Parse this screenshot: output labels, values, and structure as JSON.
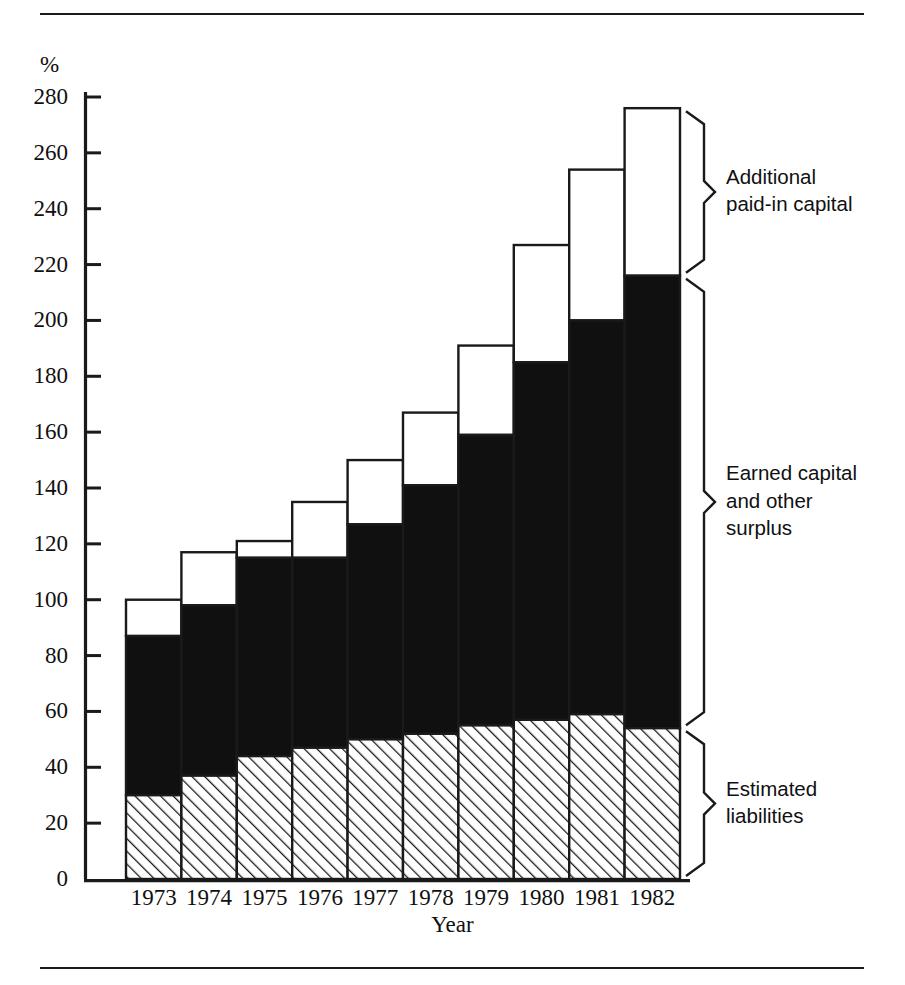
{
  "chart_data": {
    "type": "bar",
    "stacked": true,
    "title": "",
    "xlabel": "Year",
    "ylabel": "%",
    "ylim": [
      0,
      280
    ],
    "ytick_step": 20,
    "yticks": [
      0,
      20,
      40,
      60,
      80,
      100,
      120,
      140,
      160,
      180,
      200,
      220,
      240,
      260,
      280
    ],
    "categories": [
      "1973",
      "1974",
      "1975",
      "1976",
      "1977",
      "1978",
      "1979",
      "1980",
      "1981",
      "1982"
    ],
    "grid": false,
    "legend_position": "right-braces",
    "series": [
      {
        "name": "Estimated liabilities",
        "fill": "hatch-diagonal",
        "values": [
          30,
          37,
          44,
          47,
          50,
          52,
          55,
          57,
          59,
          54
        ]
      },
      {
        "name": "Earned capital and other surplus",
        "fill": "solid-black",
        "values": [
          57,
          61,
          71,
          68,
          77,
          89,
          104,
          128,
          141,
          162
        ]
      },
      {
        "name": "Additional paid-in capital",
        "fill": "white",
        "values": [
          13,
          19,
          6,
          20,
          23,
          26,
          32,
          42,
          54,
          60
        ]
      }
    ],
    "totals": [
      100,
      117,
      121,
      135,
      150,
      167,
      191,
      227,
      254,
      276
    ],
    "segment_tops": {
      "hatch_top": [
        30,
        37,
        44,
        47,
        50,
        52,
        55,
        57,
        59,
        54
      ],
      "black_top": [
        87,
        98,
        115,
        115,
        127,
        141,
        159,
        185,
        200,
        216
      ],
      "bar_top": [
        100,
        117,
        121,
        135,
        150,
        167,
        191,
        227,
        254,
        276
      ]
    }
  },
  "legend": [
    {
      "id": "additional-paid-in-capital",
      "lines": [
        "Additional",
        "paid-in capital"
      ],
      "from": 216,
      "to": 276
    },
    {
      "id": "earned-capital-and-other-surplus",
      "lines": [
        "Earned capital",
        "and other",
        "surplus"
      ],
      "from": 54,
      "to": 216
    },
    {
      "id": "estimated-liabilities",
      "lines": [
        "Estimated",
        "liabilities"
      ],
      "from": 0,
      "to": 54
    }
  ],
  "axis": {
    "y_unit": "%",
    "x_title": "Year"
  }
}
